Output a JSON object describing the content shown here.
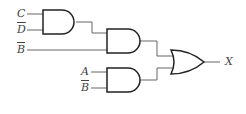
{
  "diagram": {
    "type": "logic-circuit",
    "inputs": [
      {
        "id": "in-c",
        "label": "C",
        "negated": false
      },
      {
        "id": "in-dbar",
        "label": "D",
        "negated": true
      },
      {
        "id": "in-bbar-1",
        "label": "B",
        "negated": true
      },
      {
        "id": "in-a",
        "label": "A",
        "negated": false
      },
      {
        "id": "in-bbar-2",
        "label": "B",
        "negated": true
      }
    ],
    "gates": [
      {
        "id": "and1",
        "type": "AND",
        "inputs": [
          "C",
          "D̄"
        ]
      },
      {
        "id": "and2",
        "type": "AND",
        "inputs": [
          "and1",
          "B̄"
        ]
      },
      {
        "id": "and3",
        "type": "AND",
        "inputs": [
          "A",
          "B̄"
        ]
      },
      {
        "id": "or1",
        "type": "OR",
        "inputs": [
          "and2",
          "and3"
        ]
      }
    ],
    "output": {
      "label": "X"
    },
    "colors": {
      "gate_stroke": "#222222",
      "wire": "#555555",
      "label": "#444444"
    }
  }
}
